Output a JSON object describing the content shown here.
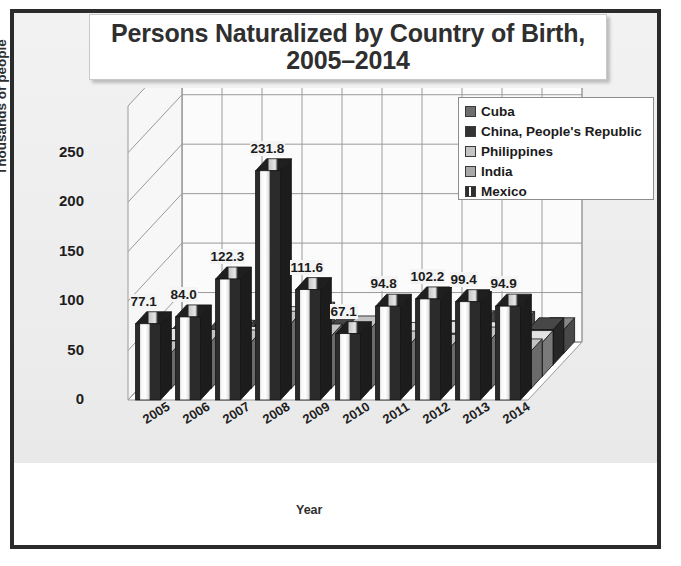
{
  "chart_data": {
    "type": "bar",
    "title": "Persons Naturalized by Country of Birth, 2005–2014",
    "title_line1": "Persons Naturalized by Country of Birth,",
    "title_line2": "2005–2014",
    "xlabel": "Year",
    "ylabel": "Thousands of people",
    "ylim": [
      0,
      275
    ],
    "yticks": [
      0,
      50,
      100,
      150,
      200,
      250
    ],
    "ytick_labels": [
      "0",
      "50",
      "100",
      "150",
      "200",
      "250"
    ],
    "grid": true,
    "legend_position": "upper-right",
    "projection": "3d-grouped-depth",
    "categories": [
      "2005",
      "2006",
      "2007",
      "2008",
      "2009",
      "2010",
      "2011",
      "2012",
      "2013",
      "2014"
    ],
    "series": [
      {
        "name": "Cuba",
        "color": "#6e6e6e",
        "pattern": "solid",
        "depth_index": 4,
        "values": [
          11.2,
          21.5,
          15.4,
          39.9,
          24.9,
          14.0,
          21.1,
          31.2,
          30.5,
          24.1
        ]
      },
      {
        "name": "China, People's Republic",
        "color": "#3a3a3a",
        "pattern": "solid",
        "depth_index": 3,
        "values": [
          31.7,
          35.4,
          33.1,
          40.0,
          37.1,
          33.9,
          32.9,
          31.9,
          35.4,
          35.8
        ]
      },
      {
        "name": "Philippines",
        "color": "#b9b9b9",
        "pattern": "solid",
        "depth_index": 2,
        "values": [
          36.7,
          30.5,
          38.8,
          58.8,
          38.9,
          35.5,
          42.8,
          44.0,
          43.5,
          34.6
        ]
      },
      {
        "name": "India",
        "color": "#a0a0a0",
        "pattern": "solid",
        "depth_index": 1,
        "values": [
          35.9,
          47.5,
          46.9,
          65.9,
          52.9,
          61.1,
          45.9,
          42.5,
          49.9,
          37.9
        ]
      },
      {
        "name": "Mexico",
        "color": "#2e2e2e",
        "pattern": "vertical-white-stripe",
        "depth_index": 0,
        "labelled": true,
        "values": [
          77.1,
          84.0,
          122.3,
          231.8,
          111.6,
          67.1,
          94.8,
          102.2,
          99.4,
          94.9
        ]
      }
    ],
    "data_labels": [
      "77.1",
      "84.0",
      "122.3",
      "231.8",
      "111.6",
      "67.1",
      "94.8",
      "102.2",
      "99.4",
      "94.9"
    ]
  },
  "legend": {
    "items": [
      {
        "label": "Cuba",
        "swatch": "#6e6e6e"
      },
      {
        "label": "China, People's Republic",
        "swatch": "#333333"
      },
      {
        "label": "Philippines",
        "swatch": "#c4c4c4"
      },
      {
        "label": "India",
        "swatch": "#a8a8a8"
      },
      {
        "label": "Mexico",
        "swatch": "#2e2e2e"
      }
    ]
  },
  "colors": {
    "frame_border": "#2b2b2b",
    "canvas_background": "#eeeeee",
    "plot_background": "#fafafa",
    "gridline": "#8c8c8c",
    "text": "#1b1b1b"
  }
}
